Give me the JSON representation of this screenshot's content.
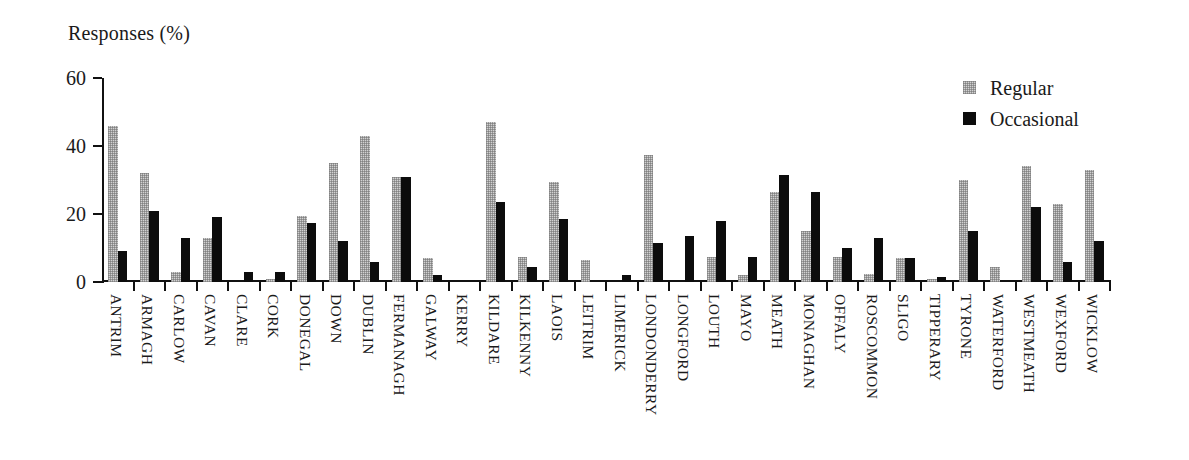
{
  "chart_data": {
    "type": "bar",
    "title": "",
    "ylabel": "Responses (%)",
    "xlabel": "",
    "ylim": [
      0,
      60
    ],
    "yticks": [
      0,
      20,
      40,
      60
    ],
    "grid": false,
    "legend_position": "top-right",
    "categories": [
      "ANTRIM",
      "ARMAGH",
      "CARLOW",
      "CAVAN",
      "CLARE",
      "CORK",
      "DONEGAL",
      "DOWN",
      "DUBLIN",
      "FERMANAGH",
      "GALWAY",
      "KERRY",
      "KILDARE",
      "KILKENNY",
      "LAOIS",
      "LEITRIM",
      "LIMERICK",
      "LONDONDERRY",
      "LONGFORD",
      "LOUTH",
      "MAYO",
      "MEATH",
      "MONAGHAN",
      "OFFALY",
      "ROSCOMMON",
      "SLIGO",
      "TIPPERARY",
      "TYRONE",
      "WATERFORD",
      "WESTMEATH",
      "WEXFORD",
      "WICKLOW"
    ],
    "series": [
      {
        "name": "Regular",
        "color": "#d2d2d2",
        "values": [
          46,
          32,
          3,
          13,
          0,
          1,
          19.5,
          35,
          43,
          31,
          7,
          0,
          47,
          7.5,
          29.5,
          6.5,
          0,
          37.5,
          0,
          7.5,
          2,
          26.5,
          15,
          7.5,
          2.5,
          7,
          1,
          30,
          4.5,
          34,
          23,
          33
        ]
      },
      {
        "name": "Occasional",
        "color": "#0c0c0c",
        "values": [
          9,
          21,
          13,
          19,
          3,
          3,
          17.5,
          12,
          6,
          31,
          2,
          0,
          23.5,
          4.5,
          18.5,
          0,
          2,
          11.5,
          13.5,
          18,
          7.5,
          31.5,
          26.5,
          10,
          13,
          7,
          1.5,
          15,
          0,
          22,
          6,
          12
        ]
      }
    ]
  },
  "legend": {
    "items": [
      {
        "label": "Regular"
      },
      {
        "label": "Occasional"
      }
    ]
  }
}
